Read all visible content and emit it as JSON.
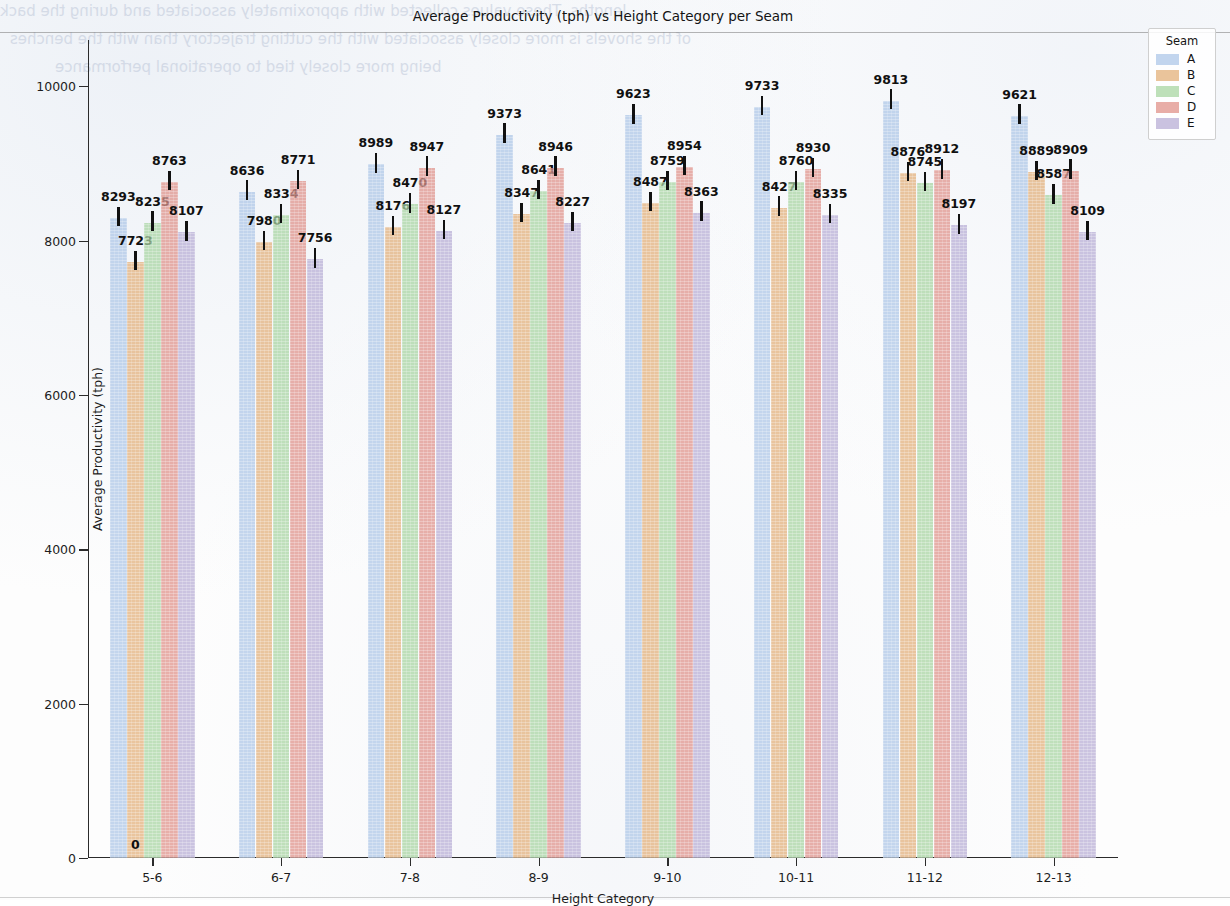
{
  "chart_data": {
    "type": "bar",
    "title": "Average Productivity (tph) vs Height Category per Seam",
    "xlabel": "Height Category",
    "ylabel": "Average Productivity (tph)",
    "categories": [
      "5-6",
      "6-7",
      "7-8",
      "8-9",
      "9-10",
      "10-11",
      "11-12",
      "12-13"
    ],
    "ylim": [
      0,
      10600
    ],
    "yticks": [
      0,
      2000,
      4000,
      6000,
      8000,
      10000
    ],
    "ytick_labels": [
      "0",
      "2000",
      "4000",
      "6000",
      "8000",
      "10000"
    ],
    "grid": false,
    "legend_title": "Seam",
    "legend_position": "upper right outside",
    "errorbars": true,
    "series": [
      {
        "name": "A",
        "color": "#aec7e8",
        "values": [
          8293,
          8636,
          8989,
          9373,
          9623,
          9733,
          9813,
          9621
        ],
        "errors": [
          150,
          150,
          150,
          150,
          150,
          150,
          150,
          150
        ]
      },
      {
        "name": "B",
        "color": "#e3b07a",
        "values": [
          7723,
          7980,
          8176,
          8347,
          8487,
          8427,
          8876,
          8889
        ],
        "errors": [
          150,
          150,
          150,
          150,
          150,
          150,
          150,
          150
        ]
      },
      {
        "name": "C",
        "color": "#a8d5a2",
        "values": [
          8235,
          8334,
          8470,
          8641,
          8759,
          8760,
          8745,
          8587
        ],
        "errors": [
          150,
          150,
          150,
          150,
          150,
          150,
          150,
          150
        ]
      },
      {
        "name": "D",
        "color": "#e0928a",
        "values": [
          8763,
          8771,
          8947,
          8946,
          8954,
          8930,
          8912,
          8909
        ],
        "errors": [
          150,
          150,
          150,
          150,
          150,
          150,
          150,
          150
        ]
      },
      {
        "name": "E",
        "color": "#b8aed6",
        "values": [
          8107,
          7756,
          8127,
          8227,
          8363,
          8335,
          8197,
          8109
        ],
        "errors": [
          150,
          150,
          150,
          150,
          150,
          150,
          150,
          150
        ]
      }
    ],
    "zero_annotation": {
      "label": "0",
      "category": "5-6",
      "series": "B"
    }
  },
  "legend": {
    "title": "Seam",
    "entries": [
      {
        "label": "A",
        "color": "#aec7e8"
      },
      {
        "label": "B",
        "color": "#e3b07a"
      },
      {
        "label": "C",
        "color": "#a8d5a2"
      },
      {
        "label": "D",
        "color": "#e0928a"
      },
      {
        "label": "E",
        "color": "#b8aed6"
      }
    ]
  },
  "page_artifacts": {
    "bleed_text": [
      "lengths. These values collected with approximately associated and during the back",
      "of the shovels is more closely associated with the cutting trajectory than with the benches",
      "being more closely tied to operational performance"
    ]
  }
}
